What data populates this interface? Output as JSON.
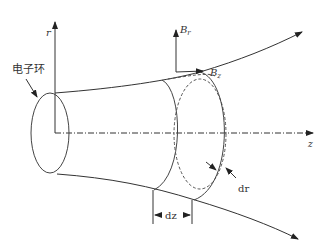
{
  "diagram": {
    "axes": {
      "r_label": "r",
      "z_label": "z"
    },
    "labels": {
      "electron_ring": "电子环",
      "B_r_main": "B",
      "B_r_sub": "r",
      "B_z_main": "B",
      "B_z_sub": "z",
      "dz": "dz",
      "dr": "dr"
    },
    "colors": {
      "stroke": "#333333",
      "background": "#ffffff"
    }
  }
}
